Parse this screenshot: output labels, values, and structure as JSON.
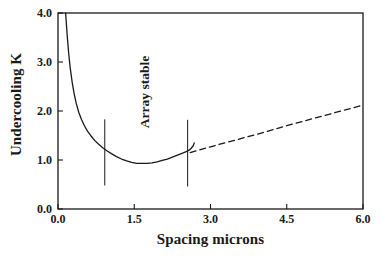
{
  "chart_data": {
    "type": "line",
    "title": "",
    "xlabel": "Spacing microns",
    "ylabel": "Undercooling K",
    "xlim": [
      0.0,
      6.0
    ],
    "ylim": [
      0.0,
      4.0
    ],
    "grid": false,
    "legend": null,
    "xticks": [
      "0.0",
      "1.5",
      "3.0",
      "4.5",
      "6.0"
    ],
    "xtick_values": [
      0.0,
      1.5,
      3.0,
      4.5,
      6.0
    ],
    "yticks": [
      "0.0",
      "1.0",
      "2.0",
      "3.0",
      "4.0"
    ],
    "ytick_values": [
      0.0,
      1.0,
      2.0,
      3.0,
      4.0
    ],
    "series": [
      {
        "name": "undercooling-curve-solid",
        "style": "solid",
        "color": "#1a1a1a",
        "points": [
          [
            0.15,
            4.0
          ],
          [
            0.18,
            3.55
          ],
          [
            0.21,
            3.18
          ],
          [
            0.24,
            2.88
          ],
          [
            0.28,
            2.58
          ],
          [
            0.32,
            2.34
          ],
          [
            0.36,
            2.15
          ],
          [
            0.41,
            1.97
          ],
          [
            0.46,
            1.83
          ],
          [
            0.52,
            1.7
          ],
          [
            0.58,
            1.59
          ],
          [
            0.65,
            1.49
          ],
          [
            0.72,
            1.4
          ],
          [
            0.8,
            1.32
          ],
          [
            0.88,
            1.25
          ],
          [
            0.96,
            1.19
          ],
          [
            1.05,
            1.13
          ],
          [
            1.15,
            1.07
          ],
          [
            1.25,
            1.02
          ],
          [
            1.35,
            0.98
          ],
          [
            1.45,
            0.95
          ],
          [
            1.55,
            0.93
          ],
          [
            1.65,
            0.93
          ],
          [
            1.75,
            0.93
          ],
          [
            1.85,
            0.94
          ],
          [
            1.95,
            0.96
          ],
          [
            2.05,
            0.99
          ],
          [
            2.15,
            1.02
          ],
          [
            2.25,
            1.06
          ],
          [
            2.35,
            1.1
          ],
          [
            2.45,
            1.14
          ],
          [
            2.52,
            1.17
          ],
          [
            2.58,
            1.2
          ],
          [
            2.62,
            1.24
          ],
          [
            2.66,
            1.29
          ],
          [
            2.68,
            1.35
          ]
        ]
      },
      {
        "name": "extrapolation-dashed",
        "style": "dashed",
        "color": "#1a1a1a",
        "points": [
          [
            2.6,
            1.15
          ],
          [
            3.0,
            1.27
          ],
          [
            3.5,
            1.41
          ],
          [
            4.0,
            1.55
          ],
          [
            4.5,
            1.7
          ],
          [
            5.0,
            1.84
          ],
          [
            5.5,
            1.98
          ],
          [
            6.0,
            2.12
          ]
        ]
      }
    ],
    "markers": [
      {
        "name": "stability-boundary-left",
        "type": "vertical-line",
        "x": 0.92,
        "y0": 0.48,
        "y1": 1.83
      },
      {
        "name": "stability-boundary-right",
        "type": "vertical-line",
        "x": 2.55,
        "y0": 0.46,
        "y1": 1.82
      }
    ],
    "annotations": [
      {
        "name": "array-stable-label",
        "text": "Array stable",
        "x": 1.55,
        "y": 2.55,
        "rotation": 90
      }
    ]
  },
  "axes": {
    "x_title": "Spacing microns",
    "y_title": "Undercooling K"
  },
  "annotation": {
    "array_stable": "Array stable"
  },
  "colors": {
    "ink": "#1a1a1a",
    "background": "#ffffff"
  }
}
